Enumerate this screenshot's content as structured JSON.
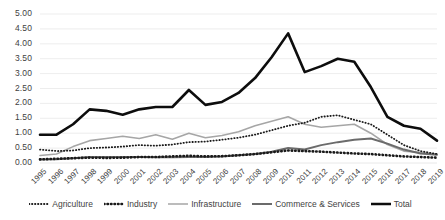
{
  "chart_data": {
    "type": "line",
    "title": "",
    "xlabel": "",
    "ylabel": "",
    "ylim": [
      0.0,
      5.0
    ],
    "ytick_step": 0.5,
    "grid": true,
    "legend_position": "bottom",
    "categories": [
      "1995",
      "1996",
      "1997",
      "1998",
      "1999",
      "2000",
      "2001",
      "2002",
      "2003",
      "2004",
      "2005",
      "2006",
      "2007",
      "2008",
      "2009",
      "2010",
      "2011",
      "2012",
      "2013",
      "2014",
      "2015",
      "2016",
      "2017",
      "2018",
      "2019"
    ],
    "ytick_labels": [
      "0.00",
      "0.50",
      "1.00",
      "1.50",
      "2.00",
      "2.50",
      "3.00",
      "3.50",
      "4.00",
      "4.50",
      "5.00"
    ],
    "series": [
      {
        "name": "Agriculture",
        "style": "fine-dotted",
        "color": "#1a1a1a",
        "values": [
          0.45,
          0.4,
          0.42,
          0.5,
          0.52,
          0.55,
          0.6,
          0.58,
          0.62,
          0.7,
          0.72,
          0.78,
          0.85,
          0.95,
          1.1,
          1.25,
          1.35,
          1.55,
          1.6,
          1.45,
          1.3,
          0.95,
          0.6,
          0.4,
          0.3
        ]
      },
      {
        "name": "Industry",
        "style": "bold-dotted",
        "color": "#1a1a1a",
        "values": [
          0.12,
          0.14,
          0.16,
          0.18,
          0.17,
          0.18,
          0.2,
          0.2,
          0.22,
          0.24,
          0.22,
          0.23,
          0.26,
          0.3,
          0.36,
          0.42,
          0.4,
          0.38,
          0.35,
          0.32,
          0.3,
          0.26,
          0.22,
          0.2,
          0.18
        ]
      },
      {
        "name": "Infrastructure",
        "style": "light-solid",
        "color": "#a6a6a6",
        "values": [
          0.25,
          0.3,
          0.55,
          0.75,
          0.82,
          0.9,
          0.82,
          0.95,
          0.8,
          1.0,
          0.85,
          0.92,
          1.05,
          1.25,
          1.4,
          1.55,
          1.3,
          1.2,
          1.25,
          1.3,
          1.0,
          0.62,
          0.4,
          0.35,
          0.3
        ]
      },
      {
        "name": "Commerce & Services",
        "style": "medium-solid",
        "color": "#6b6b6b",
        "values": [
          0.12,
          0.13,
          0.16,
          0.2,
          0.2,
          0.2,
          0.2,
          0.19,
          0.19,
          0.2,
          0.2,
          0.22,
          0.26,
          0.3,
          0.38,
          0.5,
          0.45,
          0.6,
          0.7,
          0.78,
          0.82,
          0.65,
          0.45,
          0.32,
          0.28
        ]
      },
      {
        "name": "Total",
        "style": "thick-solid",
        "color": "#0d0d0d",
        "values": [
          0.95,
          0.95,
          1.3,
          1.8,
          1.75,
          1.62,
          1.8,
          1.88,
          1.88,
          2.45,
          1.95,
          2.05,
          2.35,
          2.85,
          3.55,
          4.35,
          3.05,
          3.25,
          3.5,
          3.4,
          2.55,
          1.55,
          1.25,
          1.15,
          0.75
        ]
      }
    ]
  },
  "legend": {
    "items": [
      {
        "label": "Agriculture",
        "style": "fine-dotted",
        "color": "#1a1a1a"
      },
      {
        "label": "Industry",
        "style": "bold-dotted",
        "color": "#1a1a1a"
      },
      {
        "label": "Infrastructure",
        "style": "light-solid",
        "color": "#a6a6a6"
      },
      {
        "label": "Commerce & Services",
        "style": "medium-solid",
        "color": "#6b6b6b"
      },
      {
        "label": "Total",
        "style": "thick-solid",
        "color": "#0d0d0d"
      }
    ]
  },
  "axes": {
    "grid_color": "#e8e8e8",
    "label_color": "#3f3f3f"
  }
}
